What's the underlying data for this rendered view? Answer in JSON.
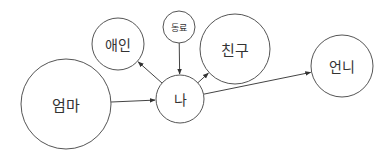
{
  "diagram": {
    "type": "relationship-graph",
    "colors": {
      "stroke": "#555555",
      "text": "#333333",
      "background": "#ffffff"
    },
    "nodes": [
      {
        "id": "mom",
        "label": "엄마",
        "cx": 66,
        "cy": 104,
        "r": 45,
        "font": 15
      },
      {
        "id": "lover",
        "label": "애인",
        "cx": 118,
        "cy": 44,
        "r": 26,
        "font": 14
      },
      {
        "id": "coworker",
        "label": "동료",
        "cx": 179,
        "cy": 27,
        "r": 16,
        "font": 9
      },
      {
        "id": "me",
        "label": "나",
        "cx": 180,
        "cy": 99,
        "r": 24,
        "font": 14
      },
      {
        "id": "friend",
        "label": "친구",
        "cx": 235,
        "cy": 49,
        "r": 35,
        "font": 15
      },
      {
        "id": "sister",
        "label": "언니",
        "cx": 342,
        "cy": 66,
        "r": 31,
        "font": 14
      }
    ],
    "edges": [
      {
        "from": "mom",
        "to": "me"
      },
      {
        "from": "coworker",
        "to": "me"
      },
      {
        "from": "me",
        "to": "lover"
      },
      {
        "from": "me",
        "to": "friend"
      },
      {
        "from": "me",
        "to": "sister"
      }
    ]
  }
}
